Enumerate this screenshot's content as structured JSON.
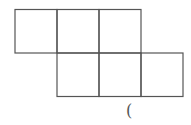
{
  "diagram": {
    "type": "cube-net",
    "line_color": "#555555",
    "squares": [
      {
        "row": 0,
        "col": 0
      },
      {
        "row": 0,
        "col": 1
      },
      {
        "row": 0,
        "col": 2
      },
      {
        "row": 1,
        "col": 1
      },
      {
        "row": 1,
        "col": 2
      },
      {
        "row": 1,
        "col": 3
      }
    ],
    "answer_bracket": "("
  }
}
